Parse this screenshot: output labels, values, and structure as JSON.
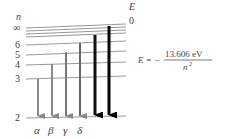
{
  "diagram": {
    "axis_left_label": "n",
    "axis_right_label": "E",
    "zero_label": "0",
    "levels": [
      {
        "n": "∞",
        "y": 27
      },
      {
        "n": "",
        "y": 30
      },
      {
        "n": "",
        "y": 33
      },
      {
        "n": "",
        "y": 37
      },
      {
        "n": "6",
        "y": 44
      },
      {
        "n": "5",
        "y": 54
      },
      {
        "n": "4",
        "y": 65
      },
      {
        "n": "3",
        "y": 79
      },
      {
        "n": "2",
        "y": 118
      }
    ],
    "transitions": [
      {
        "label": "α",
        "from": "3",
        "to": "2",
        "x": 38,
        "color": "#888888",
        "width": 2
      },
      {
        "label": "β",
        "from": "4",
        "to": "2",
        "x": 52,
        "color": "#888888",
        "width": 2
      },
      {
        "label": "γ",
        "from": "5",
        "to": "2",
        "x": 66,
        "color": "#777777",
        "width": 2
      },
      {
        "label": "δ",
        "from": "6",
        "to": "2",
        "x": 80,
        "color": "#666666",
        "width": 2
      },
      {
        "label": "",
        "from": "7",
        "to": "2",
        "x": 95,
        "color": "#111111",
        "width": 3
      },
      {
        "label": "",
        "from": "∞",
        "to": "2",
        "x": 109,
        "color": "#000000",
        "width": 3
      }
    ],
    "formula": {
      "lhs": "E = −",
      "numerator": "13.606 eV",
      "denominator": "n",
      "exponent": "2"
    },
    "colors": {
      "level_line": "#999999",
      "text": "#444444"
    }
  }
}
